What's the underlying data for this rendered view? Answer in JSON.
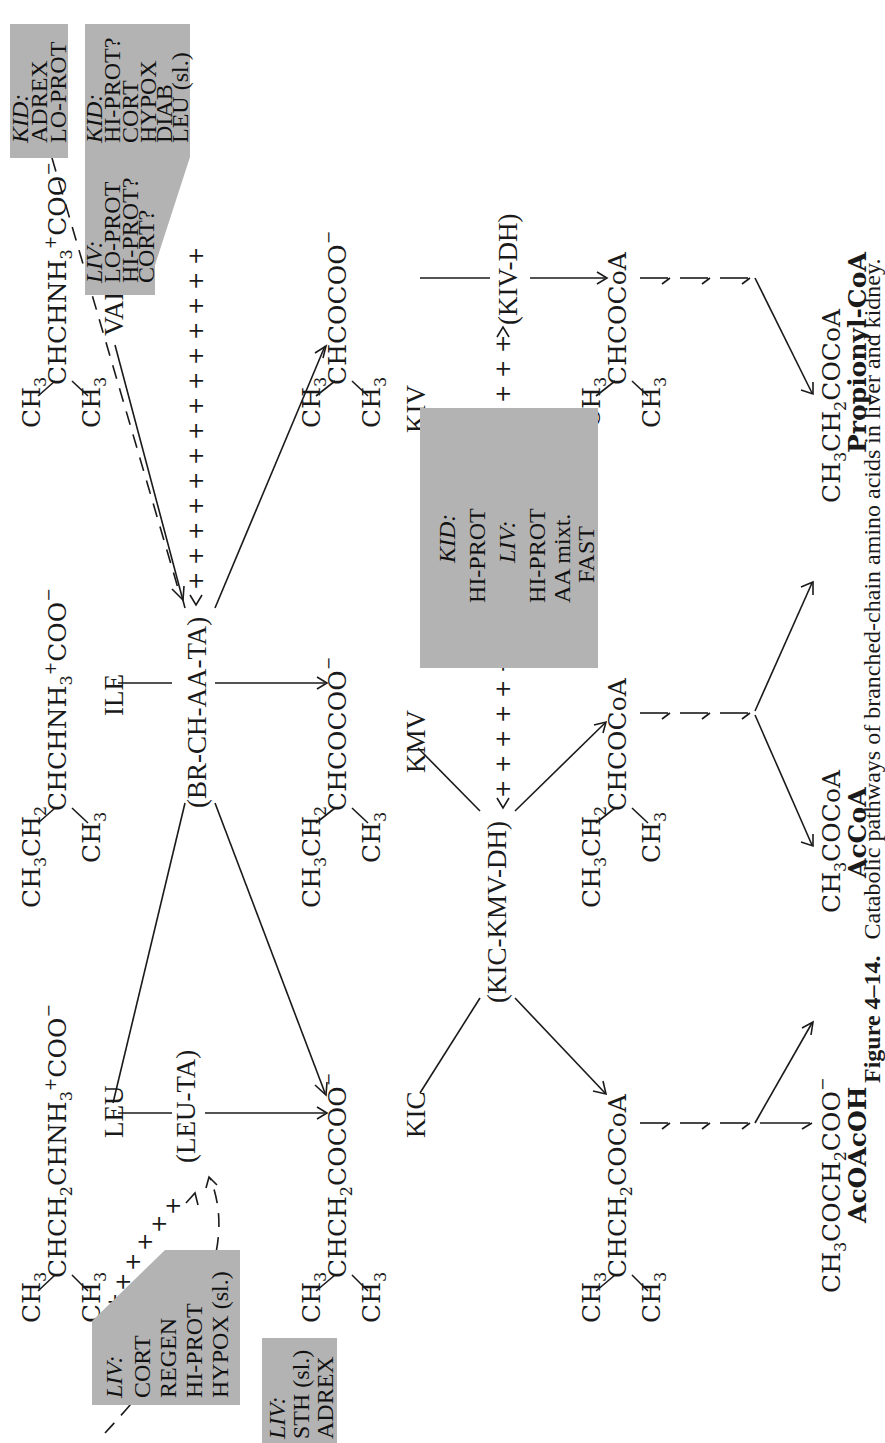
{
  "figure": {
    "number": "Figure 4–14.",
    "caption": "Catabolic pathways of branched-chain amino acids in liver and kidney."
  },
  "amino_acids": {
    "leu": {
      "label": "LEU",
      "formula_a": "CH",
      "formula_b": "CHCH",
      "formula_c": "CHNH",
      "formula_d": "COO",
      "branch": "CH"
    },
    "ile": {
      "label": "ILE",
      "left": "CH",
      "left2": "CH",
      "formula_b": "CHCHNH",
      "formula_d": "COO",
      "branch": "CH"
    },
    "val": {
      "label": "VAL",
      "left": "CH",
      "formula_b": "CHCHNH",
      "formula_d": "COO",
      "branch": "CH"
    }
  },
  "keto_acids": {
    "kic": {
      "label": "KIC",
      "left": "CH",
      "formula": "CHCH",
      "formula2": "COCOO",
      "branch": "CH"
    },
    "kmv": {
      "label": "KMV",
      "left": "CH",
      "left2": "CH",
      "formula": "CHCOCOO",
      "branch": "CH"
    },
    "kiv": {
      "label": "KIV",
      "left": "CH",
      "formula": "CHCOCOO",
      "branch": "CH"
    }
  },
  "acyl_coa": {
    "from_kic": {
      "left": "CH",
      "formula": "CHCH",
      "formula2": "COCoA",
      "branch": "CH"
    },
    "from_kmv": {
      "left": "CH",
      "left2": "CH",
      "formula": "CHCOCoA",
      "branch": "CH"
    },
    "from_kiv": {
      "left": "CH",
      "formula": "CHCOCoA",
      "branch": "CH"
    }
  },
  "products": [
    {
      "formula_a": "CH",
      "formula_b": "COCH",
      "formula_c": "COO",
      "name": "AcOAcOH"
    },
    {
      "formula_a": "CH",
      "formula_b": "COCoA",
      "name": "AcCoA"
    },
    {
      "formula_a": "CH",
      "formula_b": "CH",
      "formula_c": "COCoA",
      "name": "Propionyl-CoA"
    }
  ],
  "enzymes": {
    "leu_ta": "(LEU-TA)",
    "br_ch_aa_ta": "(BR-CH-AA-TA)",
    "kic_kmv_dh": "(KIC-KMV-DH)",
    "kiv_dh": "(KIV-DH)"
  },
  "regulation_boxes": {
    "box_leu_ta_liv": {
      "head": "LIV:",
      "lines": [
        "CORT",
        "REGEN",
        "HI-PROT",
        "HYPOX (sl.)"
      ]
    },
    "box_leu_ta_sth": {
      "head": "LIV:",
      "lines": [
        "STH (sl.)",
        "ADREX"
      ]
    },
    "box_br_kid_adrex": {
      "head": "KID:",
      "lines": [
        "ADREX",
        "LO-PROT"
      ]
    },
    "box_br_liv_kid": {
      "liv_head": "LIV:",
      "liv_lines": [
        "LO-PROT",
        "HI-PROT?",
        "CORT?"
      ],
      "kid_head": "KID:",
      "kid_lines": [
        "HI-PROT?",
        "CORT",
        "HYPOX",
        "DIAB",
        "LEU (sl.)"
      ]
    },
    "box_dh": {
      "kid_head": "KID:",
      "kid_lines": [
        "HI-PROT"
      ],
      "liv_head": "LIV:",
      "liv_lines": [
        "HI-PROT",
        "AA mixt.",
        "FAST"
      ]
    }
  },
  "subscripts": {
    "two": "2",
    "three": "3",
    "plus": "+",
    "minus": "−"
  },
  "legend_symbols": {
    "positive_effect": "+",
    "arrow": "→"
  }
}
